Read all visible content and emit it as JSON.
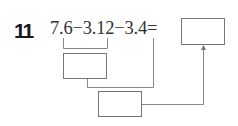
{
  "question": {
    "number": "11",
    "expression": "7.6−3.12−3.4="
  },
  "boxes": {
    "answer": {
      "value": ""
    },
    "step1": {
      "value": ""
    },
    "step2": {
      "value": ""
    }
  }
}
